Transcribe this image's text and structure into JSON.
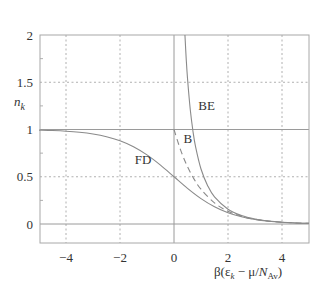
{
  "chart_data": {
    "type": "line",
    "title": "",
    "xlabel": "β(ε_k − μ/N_Av)",
    "ylabel": "n_k",
    "xlim": [
      -5,
      5
    ],
    "ylim": [
      -0.2,
      2
    ],
    "xticks": [
      -4,
      -2,
      0,
      2,
      4
    ],
    "yticks": [
      0,
      0.5,
      1,
      1.5,
      2
    ],
    "xtick_labels": [
      "−4",
      "−2",
      "0",
      "2",
      "4"
    ],
    "ytick_labels": [
      "0",
      "0.5",
      "1",
      "1.5",
      "2"
    ],
    "grid": true,
    "legend": "inline labels",
    "series": [
      {
        "name": "FD",
        "style": "solid",
        "formula": "1/(exp(x)+1)",
        "x": [
          -5,
          -4.5,
          -4,
          -3.5,
          -3,
          -2.5,
          -2,
          -1.5,
          -1,
          -0.5,
          0,
          0.5,
          1,
          1.5,
          2,
          2.5,
          3,
          3.5,
          4,
          4.5,
          5
        ],
        "values": [
          0.9933,
          0.989,
          0.982,
          0.9707,
          0.9526,
          0.9241,
          0.8808,
          0.8176,
          0.7311,
          0.6225,
          0.5,
          0.3775,
          0.2689,
          0.1824,
          0.1192,
          0.0759,
          0.0474,
          0.0293,
          0.018,
          0.011,
          0.0067
        ]
      },
      {
        "name": "B",
        "style": "dashed",
        "formula": "exp(-x)",
        "x": [
          0,
          0.25,
          0.5,
          0.75,
          1,
          1.5,
          2,
          2.5,
          3,
          3.5,
          4,
          4.5,
          5
        ],
        "values": [
          1,
          0.7788,
          0.6065,
          0.4724,
          0.3679,
          0.2231,
          0.1353,
          0.0821,
          0.0498,
          0.0302,
          0.0183,
          0.0111,
          0.0067
        ]
      },
      {
        "name": "BE",
        "style": "solid",
        "formula": "1/(exp(x)-1)",
        "x": [
          0.405,
          0.45,
          0.5,
          0.6,
          0.7,
          0.8,
          1,
          1.25,
          1.5,
          2,
          2.5,
          3,
          3.5,
          4,
          4.5,
          5
        ],
        "values": [
          2.0,
          1.758,
          1.5415,
          1.2164,
          0.9867,
          0.816,
          0.582,
          0.4033,
          0.2872,
          0.1565,
          0.0894,
          0.0524,
          0.0311,
          0.0187,
          0.0112,
          0.0068
        ]
      }
    ],
    "annotations": [
      {
        "text": "FD",
        "x": -1.45,
        "y": 0.64
      },
      {
        "text": "B",
        "x": 0.35,
        "y": 0.86
      },
      {
        "text": "BE",
        "x": 0.9,
        "y": 1.21
      }
    ]
  },
  "labels": {
    "ylabel_main": "n",
    "ylabel_sub": "k",
    "xlabel_prefix": "β(ε",
    "xlabel_sub1": "k",
    "xlabel_mid": " − μ/",
    "xlabel_N": "N",
    "xlabel_sub2": "Av",
    "xlabel_suffix": ")"
  },
  "colors": {
    "curve": "#8a8a8a",
    "axis": "#9a9a9a",
    "grid": "#b0b0b0",
    "text": "#333333"
  }
}
